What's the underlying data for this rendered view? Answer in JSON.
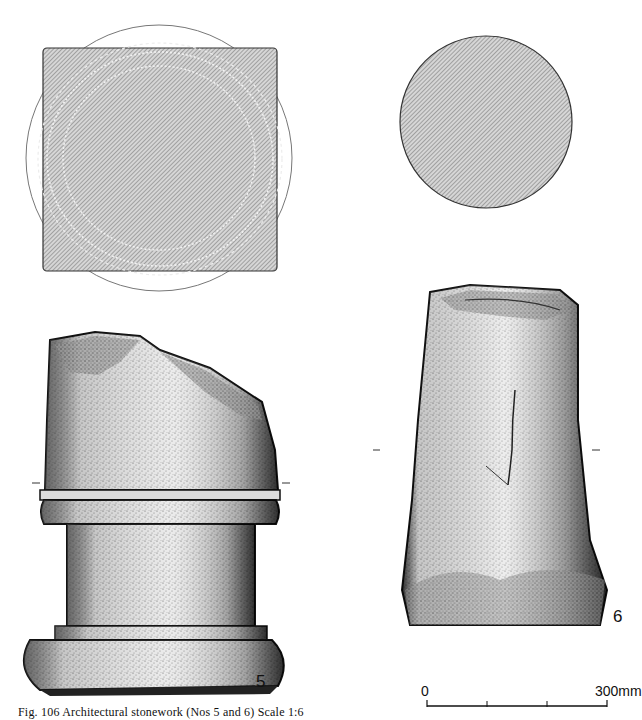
{
  "figure": {
    "caption": "Fig. 106 Architectural stonework (Nos 5 and 6) Scale 1:6",
    "objects": [
      {
        "number": "5",
        "description": "Column base with square plinth, plan view above"
      },
      {
        "number": "6",
        "description": "Tapered column shaft fragment, circular plan view above"
      }
    ],
    "scale_bar": {
      "start_label": "0",
      "end_label": "300mm",
      "ticks": 4
    }
  },
  "colors": {
    "ink": "#111111",
    "hatch_fill": "#bdbdbd",
    "stipple_light": "#e4e4e4",
    "stipple_mid": "#b8b8b8",
    "stipple_dark": "#5a5a5a",
    "background": "#ffffff"
  }
}
